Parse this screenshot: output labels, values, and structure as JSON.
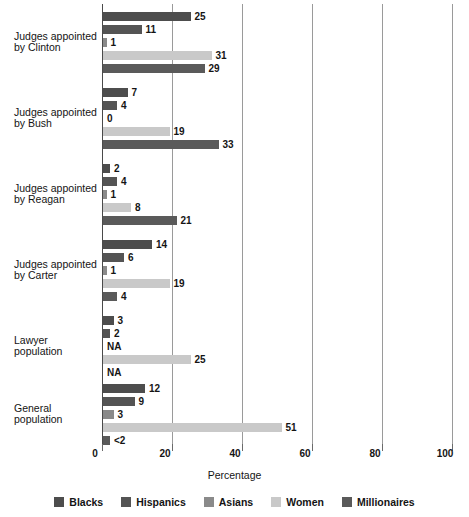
{
  "chart_data": {
    "type": "bar",
    "orientation": "horizontal",
    "title": "",
    "xlabel": "Percentage",
    "ylabel": "",
    "xlim": [
      0,
      100
    ],
    "xticks": [
      0,
      20,
      40,
      60,
      80,
      100
    ],
    "xticklabels": [
      "0",
      "20",
      "40",
      "60",
      "80",
      "100"
    ],
    "grid": "vertical",
    "legend_position": "bottom",
    "categories": [
      "Judges appointed by Clinton",
      "Judges appointed by Bush",
      "Judges appointed by Reagan",
      "Judges appointed by Carter",
      "Lawyer population",
      "General population"
    ],
    "series": [
      {
        "name": "Blacks",
        "color": "#4d4d4d",
        "values": [
          25,
          7,
          2,
          14,
          3,
          12
        ],
        "labels": [
          "25",
          "7",
          "2",
          "14",
          "3",
          "12"
        ]
      },
      {
        "name": "Hispanics",
        "color": "#545454",
        "values": [
          11,
          4,
          4,
          6,
          2,
          9
        ],
        "labels": [
          "11",
          "4",
          "4",
          "6",
          "2",
          "9"
        ]
      },
      {
        "name": "Asians",
        "color": "#8a8a8a",
        "values": [
          1,
          0,
          1,
          1,
          null,
          3
        ],
        "labels": [
          "1",
          "0",
          "1",
          "1",
          "NA",
          "3"
        ]
      },
      {
        "name": "Women",
        "color": "#c9c9c9",
        "values": [
          31,
          19,
          8,
          19,
          25,
          51
        ],
        "labels": [
          "31",
          "19",
          "8",
          "19",
          "25",
          "51"
        ]
      },
      {
        "name": "Millionaires",
        "color": "#5a5a5a",
        "values": [
          29,
          33,
          21,
          4,
          null,
          2
        ],
        "labels": [
          "29",
          "33",
          "21",
          "4",
          "NA",
          "<2"
        ]
      }
    ]
  },
  "labels": {
    "cat_0_line1": "Judges appointed",
    "cat_0_line2": "by Clinton",
    "cat_1_line1": "Judges appointed",
    "cat_1_line2": "by Bush",
    "cat_2_line1": "Judges appointed",
    "cat_2_line2": "by Reagan",
    "cat_3_line1": "Judges appointed",
    "cat_3_line2": "by Carter",
    "cat_4_line1": "Lawyer",
    "cat_4_line2": "population",
    "cat_5_line1": "General",
    "cat_5_line2": "population"
  },
  "legend": {
    "items": [
      {
        "label": "Blacks",
        "color": "#4d4d4d"
      },
      {
        "label": "Hispanics",
        "color": "#545454"
      },
      {
        "label": "Asians",
        "color": "#8a8a8a"
      },
      {
        "label": "Women",
        "color": "#c9c9c9"
      },
      {
        "label": "Millionaires",
        "color": "#5a5a5a"
      }
    ]
  },
  "axis": {
    "xlabel": "Percentage",
    "ticks": [
      "0",
      "20",
      "40",
      "60",
      "80",
      "100"
    ]
  }
}
